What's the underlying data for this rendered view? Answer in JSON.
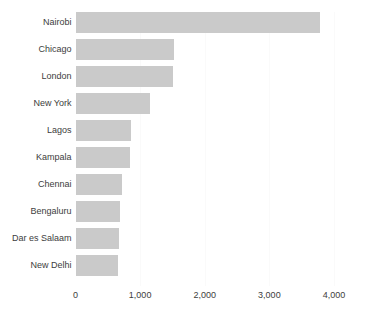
{
  "chart_data": {
    "type": "bar",
    "orientation": "horizontal",
    "title": "",
    "subtitle": "",
    "xlabel": "",
    "ylabel": "",
    "xlim": [
      0,
      4000
    ],
    "grid": true,
    "grid_axis": "x",
    "legend": false,
    "legend_position": "none",
    "bar_color": "#cacaca",
    "background_color": "#ffffff",
    "text_color": "#3d3d3d",
    "categories": [
      "Nairobi",
      "Chicago",
      "London",
      "New York",
      "Lagos",
      "Kampala",
      "Chennai",
      "Bengaluru",
      "Dar es Salaam",
      "New Delhi"
    ],
    "values": [
      3780,
      1530,
      1515,
      1160,
      855,
      850,
      725,
      695,
      680,
      665
    ],
    "xticks": [
      0,
      1000,
      2000,
      3000,
      4000
    ],
    "xticklabels": [
      "0",
      "1,000",
      "2,000",
      "3,000",
      "4,000"
    ]
  }
}
